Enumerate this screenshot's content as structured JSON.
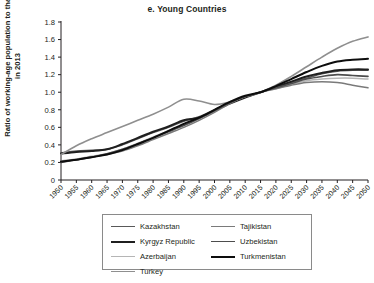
{
  "chart_data": {
    "type": "line",
    "title": "e. Young Countries",
    "xlabel": "",
    "ylabel": "Ratio of working-age population to that in 2013",
    "xlim": [
      1950,
      2050
    ],
    "ylim": [
      0,
      1.8
    ],
    "grid": false,
    "legend_position": "bottom",
    "ytick_labels": [
      "0",
      "0.2",
      "0.4",
      "0.6",
      "0.8",
      "1.0",
      "1.2",
      "1.4",
      "1.6",
      "1.8"
    ],
    "ytick_values": [
      0,
      0.2,
      0.4,
      0.6,
      0.8,
      1.0,
      1.2,
      1.4,
      1.6,
      1.8
    ],
    "x": [
      1950,
      1955,
      1960,
      1965,
      1970,
      1975,
      1980,
      1985,
      1990,
      1995,
      2000,
      2005,
      2010,
      2015,
      2020,
      2025,
      2030,
      2035,
      2040,
      2045,
      2050
    ],
    "xtick_labels": [
      "1950",
      "1955",
      "1960",
      "1965",
      "1970",
      "1975",
      "1980",
      "1985",
      "1990",
      "1995",
      "2000",
      "2005",
      "2010",
      "2015",
      "2020",
      "2025",
      "2030",
      "2035",
      "2040",
      "2045",
      "2050"
    ],
    "series": [
      {
        "name": "Kazakhstan",
        "color": "#595959",
        "width": 1.5,
        "values": [
          0.31,
          0.33,
          0.34,
          0.35,
          0.4,
          0.47,
          0.54,
          0.6,
          0.67,
          0.72,
          0.8,
          0.88,
          0.95,
          1.0,
          1.05,
          1.11,
          1.16,
          1.21,
          1.24,
          1.25,
          1.25
        ]
      },
      {
        "name": "Kyrgyz Republic",
        "color": "#1f1f1f",
        "width": 2.0,
        "values": [
          0.3,
          0.32,
          0.33,
          0.35,
          0.41,
          0.48,
          0.55,
          0.61,
          0.68,
          0.71,
          0.79,
          0.87,
          0.94,
          1.0,
          1.06,
          1.12,
          1.18,
          1.22,
          1.25,
          1.26,
          1.26
        ]
      },
      {
        "name": "Azerbaijan",
        "color": "#b5b5b5",
        "width": 1.5,
        "values": [
          0.22,
          0.24,
          0.27,
          0.3,
          0.35,
          0.42,
          0.49,
          0.56,
          0.63,
          0.7,
          0.79,
          0.88,
          0.95,
          1.0,
          1.04,
          1.09,
          1.13,
          1.15,
          1.16,
          1.16,
          1.15
        ]
      },
      {
        "name": "Turkey",
        "color": "#8f8f8f",
        "width": 1.6,
        "values": [
          0.29,
          0.39,
          0.47,
          0.54,
          0.61,
          0.68,
          0.75,
          0.83,
          0.92,
          0.9,
          0.86,
          0.89,
          0.95,
          1.0,
          1.08,
          1.18,
          1.29,
          1.4,
          1.5,
          1.58,
          1.63
        ]
      },
      {
        "name": "Tajikistan",
        "color": "#7a7a7a",
        "width": 1.5,
        "values": [
          0.21,
          0.23,
          0.26,
          0.29,
          0.33,
          0.39,
          0.46,
          0.53,
          0.6,
          0.68,
          0.77,
          0.87,
          0.95,
          1.0,
          1.04,
          1.08,
          1.11,
          1.12,
          1.11,
          1.08,
          1.05
        ]
      },
      {
        "name": "Uzbekistan",
        "color": "#4d4d4d",
        "width": 1.6,
        "values": [
          0.2,
          0.23,
          0.26,
          0.3,
          0.35,
          0.41,
          0.48,
          0.55,
          0.62,
          0.7,
          0.79,
          0.88,
          0.95,
          1.0,
          1.05,
          1.1,
          1.15,
          1.18,
          1.2,
          1.19,
          1.18
        ]
      },
      {
        "name": "Turkmenistan",
        "color": "#0d0d0d",
        "width": 2.0,
        "values": [
          0.21,
          0.23,
          0.26,
          0.29,
          0.34,
          0.41,
          0.48,
          0.56,
          0.64,
          0.71,
          0.8,
          0.89,
          0.96,
          1.0,
          1.07,
          1.15,
          1.23,
          1.3,
          1.35,
          1.37,
          1.38
        ]
      }
    ],
    "legend_columns": [
      [
        "Kazakhstan",
        "Kyrgyz Republic",
        "Azerbaijan",
        "Turkey"
      ],
      [
        "Tajikistan",
        "Uzbekistan",
        "Turkmenistan"
      ]
    ]
  }
}
